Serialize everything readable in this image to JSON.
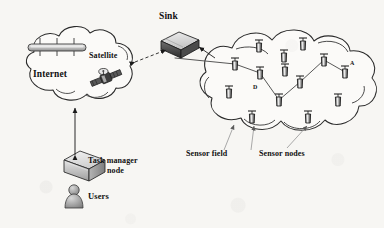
{
  "figure": {
    "background_color": "#f7f6f3",
    "ink_color": "#111111",
    "line_color": "#2a2a2a"
  },
  "labels": {
    "internet": "Internet",
    "satellite": "Satellite",
    "sink": "Sink",
    "task_manager_line1": "Task manager",
    "task_manager_line2": "node",
    "users": "Users",
    "sensor_field": "Sensor field",
    "sensor_nodes": "Sensor nodes",
    "node_a": "A",
    "node_d": "D"
  },
  "icons": {
    "internet_bus": "network-bus-icon",
    "satellite": "satellite-icon",
    "sink": "sink-box-icon",
    "task_manager": "server-box-icon",
    "user": "user-person-icon",
    "sensor_node": "sensor-node-icon"
  },
  "clouds": [
    {
      "name": "internet-cloud",
      "cx": 77,
      "cy": 68,
      "rx": 66,
      "ry": 42
    },
    {
      "name": "sensor-field-cloud",
      "cx": 290,
      "cy": 85,
      "rx": 92,
      "ry": 57
    }
  ],
  "sensor_nodes": [
    {
      "id": "n1",
      "x": 259,
      "y": 46,
      "label": ""
    },
    {
      "id": "n2",
      "x": 284,
      "y": 56,
      "label": ""
    },
    {
      "id": "n3",
      "x": 303,
      "y": 44,
      "label": ""
    },
    {
      "id": "n4",
      "x": 235,
      "y": 64,
      "label": ""
    },
    {
      "id": "n5",
      "x": 260,
      "y": 73,
      "label": "D"
    },
    {
      "id": "n6",
      "x": 285,
      "y": 70,
      "label": ""
    },
    {
      "id": "n7",
      "x": 324,
      "y": 60,
      "label": ""
    },
    {
      "id": "n8",
      "x": 345,
      "y": 72,
      "label": "A"
    },
    {
      "id": "n9",
      "x": 229,
      "y": 92,
      "label": ""
    },
    {
      "id": "n10",
      "x": 300,
      "y": 82,
      "label": ""
    },
    {
      "id": "n11",
      "x": 279,
      "y": 100,
      "label": ""
    },
    {
      "id": "n12",
      "x": 252,
      "y": 117,
      "label": ""
    },
    {
      "id": "n13",
      "x": 308,
      "y": 117,
      "label": ""
    },
    {
      "id": "n14",
      "x": 338,
      "y": 100,
      "label": ""
    }
  ],
  "routes": [
    {
      "name": "multi-hop-path",
      "points": "235,64 260,73 279,100 300,82 324,60 345,72"
    },
    {
      "name": "sink-to-field-link",
      "points": "175,58 235,64"
    }
  ],
  "connections": [
    {
      "name": "cloud-to-sink-link",
      "type": "dashed-double-arrow"
    },
    {
      "name": "cloud-to-taskmanager-link",
      "type": "double-arrow"
    },
    {
      "name": "sensor-field-leader",
      "type": "leader-arrow"
    },
    {
      "name": "sensor-nodes-leader-left",
      "type": "leader-arrow"
    },
    {
      "name": "sensor-nodes-leader-right",
      "type": "leader-arrow"
    }
  ]
}
